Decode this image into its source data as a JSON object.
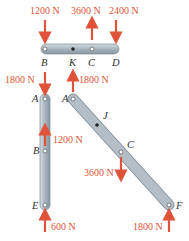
{
  "colors": {
    "force": "#e0533a",
    "bar": "#b9c4cc",
    "bar_edge": "#8a96a0",
    "text": "#333333"
  },
  "forces": {
    "f_b_top": "1200 N",
    "f_c_top": "3600 N",
    "f_d_top": "2400 N",
    "f_a_left": "1800 N",
    "f_a_slant": "1800 N",
    "f_b_mid": "1200 N",
    "f_c_slant": "3600 N",
    "f_e": "600 N",
    "f_f": "1800 N"
  },
  "points": {
    "B_top": "B",
    "K": "K",
    "C_top": "C",
    "D": "D",
    "A_left": "A",
    "B_left": "B",
    "E": "E",
    "A_slant": "A",
    "J": "J",
    "C_slant": "C",
    "F": "F"
  }
}
